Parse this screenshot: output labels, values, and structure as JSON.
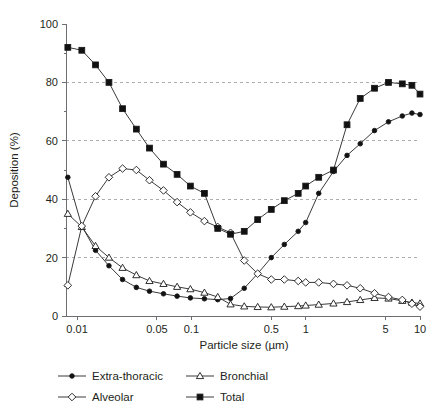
{
  "chart_data": {
    "type": "line",
    "title": "",
    "xlabel": "Particle size (µm)",
    "ylabel": "Deposition (%)",
    "xscale": "log",
    "xlim": [
      0.008,
      10
    ],
    "ylim": [
      0,
      100
    ],
    "yticks": [
      0,
      20,
      40,
      60,
      80,
      100
    ],
    "yticklabels": [
      "0",
      "20",
      "40",
      "60",
      "80",
      "100"
    ],
    "yminorticks": [
      10,
      30,
      50,
      70,
      90
    ],
    "xticks": [
      0.01,
      0.05,
      0.1,
      0.5,
      1,
      5,
      10
    ],
    "xticklabels": [
      "0.01",
      "0.05",
      "0.1",
      "0.5",
      "1",
      "5",
      "10"
    ],
    "gridlines": {
      "y": [
        20,
        40,
        60,
        80
      ],
      "style": "dashed",
      "x": false
    },
    "legend_position": "below",
    "series": [
      {
        "name": "Extra-thoracic",
        "marker": "filled-circle",
        "x": [
          0.0083,
          0.011,
          0.0145,
          0.019,
          0.025,
          0.033,
          0.043,
          0.057,
          0.075,
          0.098,
          0.13,
          0.17,
          0.22,
          0.29,
          0.38,
          0.5,
          0.65,
          0.86,
          1.0,
          1.3,
          1.75,
          2.3,
          3.0,
          4.0,
          5.3,
          7.0,
          8.5,
          10.0
        ],
        "y": [
          47.5,
          30.8,
          22.5,
          17.2,
          12.5,
          9.8,
          8.5,
          7.6,
          6.8,
          6.2,
          5.9,
          5.6,
          6.0,
          9.5,
          14.5,
          20.0,
          24.5,
          29.0,
          32.0,
          42.0,
          49.5,
          55.0,
          59.0,
          63.5,
          66.5,
          68.5,
          69.5,
          69.0
        ]
      },
      {
        "name": "Bronchial",
        "marker": "open-triangle",
        "x": [
          0.0083,
          0.011,
          0.0145,
          0.019,
          0.025,
          0.033,
          0.043,
          0.057,
          0.075,
          0.098,
          0.13,
          0.17,
          0.22,
          0.29,
          0.38,
          0.5,
          0.65,
          0.86,
          1.0,
          1.3,
          1.75,
          2.3,
          3.0,
          4.0,
          5.3,
          7.0,
          8.5,
          10.0
        ],
        "y": [
          35.0,
          30.5,
          24.0,
          20.0,
          16.5,
          14.0,
          12.0,
          11.0,
          10.0,
          9.2,
          8.0,
          6.5,
          4.0,
          3.3,
          3.1,
          3.0,
          3.2,
          3.4,
          3.6,
          3.9,
          4.3,
          4.8,
          5.5,
          6.2,
          6.0,
          5.2,
          4.6,
          4.3
        ]
      },
      {
        "name": "Alveolar",
        "marker": "open-diamond",
        "x": [
          0.0083,
          0.011,
          0.0145,
          0.019,
          0.025,
          0.033,
          0.043,
          0.057,
          0.075,
          0.098,
          0.13,
          0.17,
          0.22,
          0.29,
          0.38,
          0.5,
          0.65,
          0.86,
          1.0,
          1.3,
          1.75,
          2.3,
          3.0,
          4.0,
          5.3,
          7.0,
          8.5,
          10.0
        ],
        "y": [
          10.5,
          30.8,
          41.0,
          47.5,
          50.5,
          50.0,
          46.5,
          43.0,
          39.0,
          35.5,
          32.5,
          30.5,
          28.5,
          19.0,
          14.5,
          12.5,
          12.5,
          12.0,
          11.5,
          11.5,
          11.0,
          10.5,
          9.5,
          7.8,
          6.5,
          5.5,
          4.2,
          3.2
        ]
      },
      {
        "name": "Total",
        "marker": "filled-square",
        "x": [
          0.0083,
          0.011,
          0.0145,
          0.019,
          0.025,
          0.033,
          0.043,
          0.057,
          0.075,
          0.098,
          0.13,
          0.17,
          0.22,
          0.29,
          0.38,
          0.5,
          0.65,
          0.86,
          1.0,
          1.3,
          1.75,
          2.3,
          3.0,
          4.0,
          5.3,
          7.0,
          8.5,
          10.0
        ],
        "y": [
          92.0,
          91.0,
          86.0,
          80.0,
          71.0,
          64.0,
          57.5,
          52.0,
          48.5,
          44.5,
          42.0,
          30.0,
          28.0,
          29.0,
          33.0,
          36.5,
          39.5,
          42.0,
          44.5,
          47.5,
          50.0,
          65.5,
          74.5,
          78.0,
          80.0,
          79.5,
          79.0,
          76.0
        ]
      }
    ]
  },
  "legend": {
    "items": [
      {
        "label": "Extra-thoracic",
        "marker": "filled-circle"
      },
      {
        "label": "Bronchial",
        "marker": "open-triangle"
      },
      {
        "label": "Alveolar",
        "marker": "open-diamond"
      },
      {
        "label": "Total",
        "marker": "filled-square"
      }
    ]
  }
}
